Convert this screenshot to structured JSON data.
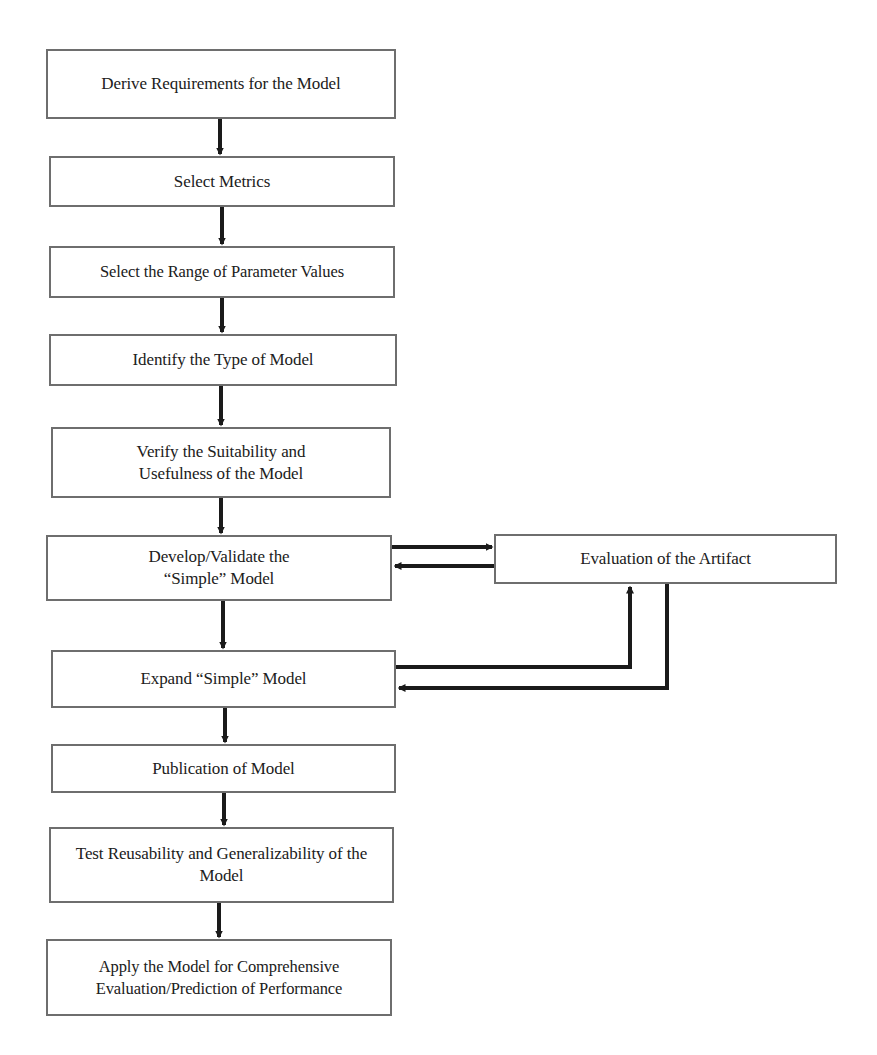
{
  "diagram": {
    "type": "flowchart",
    "steps": [
      {
        "id": "s1",
        "label": "Derive Requirements for the Model"
      },
      {
        "id": "s2",
        "label": "Select Metrics"
      },
      {
        "id": "s3",
        "label": "Select the Range of Parameter Values"
      },
      {
        "id": "s4",
        "label": "Identify the Type of Model"
      },
      {
        "id": "s5",
        "label": "Verify the Suitability and Usefulness of the Model"
      },
      {
        "id": "s6",
        "label": "Develop/Validate the “Simple” Model"
      },
      {
        "id": "s7",
        "label": "Expand “Simple” Model"
      },
      {
        "id": "s8",
        "label": "Publication of Model"
      },
      {
        "id": "s9",
        "label": "Test Reusability and Generalizability of the Model"
      },
      {
        "id": "s10",
        "label": "Apply the Model for Comprehensive Evaluation/Prediction of Performance"
      }
    ],
    "side_node": {
      "id": "artifact",
      "label": "Evaluation of the Artifact"
    },
    "edges": [
      {
        "from": "s1",
        "to": "s2"
      },
      {
        "from": "s2",
        "to": "s3"
      },
      {
        "from": "s3",
        "to": "s4"
      },
      {
        "from": "s4",
        "to": "s5"
      },
      {
        "from": "s5",
        "to": "s6"
      },
      {
        "from": "s6",
        "to": "artifact"
      },
      {
        "from": "artifact",
        "to": "s6"
      },
      {
        "from": "s6",
        "to": "s7"
      },
      {
        "from": "s7",
        "to": "artifact"
      },
      {
        "from": "artifact",
        "to": "s7"
      },
      {
        "from": "s7",
        "to": "s8"
      },
      {
        "from": "s8",
        "to": "s9"
      },
      {
        "from": "s9",
        "to": "s10"
      }
    ],
    "colors": {
      "box_border": "#6e6e6e",
      "arrow": "#1a1a1a",
      "text": "#202020",
      "background": "#ffffff"
    }
  }
}
